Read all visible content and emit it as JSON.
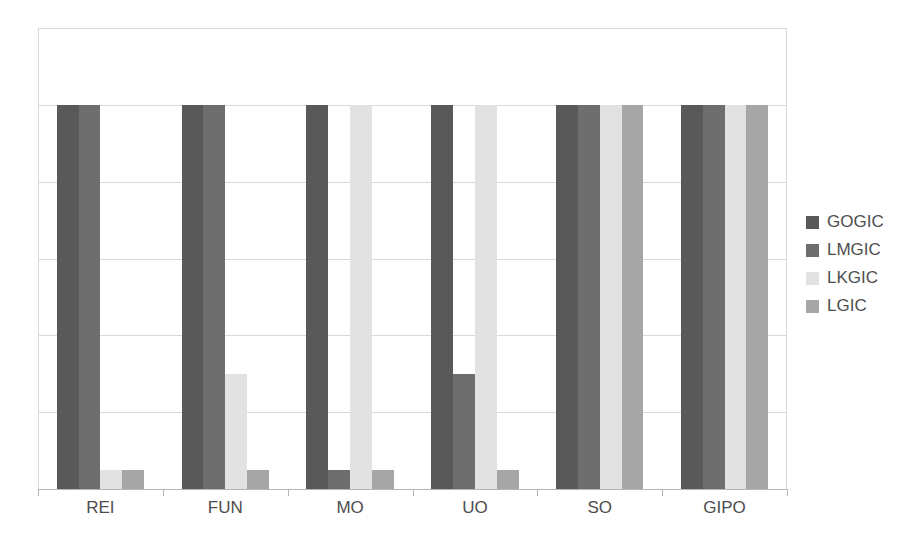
{
  "chart_data": {
    "type": "bar",
    "title": "",
    "subtitle": "",
    "xlabel": "",
    "ylabel": "",
    "categories": [
      "REI",
      "FUN",
      "MO",
      "UO",
      "SO",
      "GIPO"
    ],
    "series": [
      {
        "name": "GOGIC",
        "color": "#595959",
        "values": [
          100,
          100,
          100,
          100,
          100,
          100
        ]
      },
      {
        "name": "LMGIC",
        "color": "#6e6e6e",
        "values": [
          100,
          100,
          5,
          30,
          100,
          100
        ]
      },
      {
        "name": "LKGIC",
        "color": "#e2e2e2",
        "values": [
          5,
          30,
          100,
          100,
          100,
          100
        ]
      },
      {
        "name": "LGIC",
        "color": "#a6a6a6",
        "values": [
          5,
          5,
          5,
          5,
          100,
          100
        ]
      }
    ],
    "ylim": [
      0,
      120
    ],
    "gridlines": [
      0,
      20,
      40,
      60,
      80,
      100,
      120
    ],
    "grid": true,
    "y_tick_labels": [],
    "legend_position": "right",
    "annotations": []
  },
  "legend": {
    "items": [
      {
        "label": "GOGIC"
      },
      {
        "label": "LMGIC"
      },
      {
        "label": "LKGIC"
      },
      {
        "label": "LGIC"
      }
    ]
  },
  "colors": {
    "gridline": "#d9d9d9",
    "axis": "#b5b5b5",
    "text": "#4d4d4d",
    "background": "#ffffff"
  }
}
